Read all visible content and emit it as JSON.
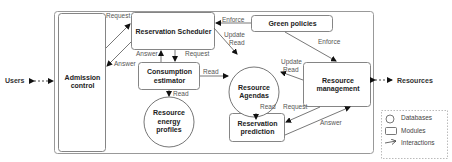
{
  "external": {
    "users": "Users",
    "resources": "Resources"
  },
  "modules": {
    "admission_control": "Admission control",
    "reservation_scheduler": "Reservation Scheduler",
    "consumption_estimator": "Consumption estimator",
    "green_policies": "Green policies",
    "resource_management": "Resource management",
    "reservation_prediction": "Reservation prediction"
  },
  "databases": {
    "resource_agendas": "Resource Agendas",
    "resource_energy_profiles": "Resource energy profiles"
  },
  "interactions": {
    "admission_to_scheduler": "Request",
    "scheduler_to_admission": "Answer",
    "estimator_to_scheduler": "Answer",
    "scheduler_to_estimator": "Request",
    "estimator_to_agendas": "Read",
    "estimator_to_profiles": "Read",
    "green_to_scheduler": "Enforce",
    "green_to_management": "Enforce",
    "scheduler_to_agendas_update": "Update",
    "scheduler_to_agendas_read": "Read",
    "management_to_agendas_update": "Update",
    "management_to_agendas_read": "Read",
    "prediction_to_agendas": "Read",
    "management_to_prediction": "Request",
    "prediction_to_management": "Answer"
  },
  "legend": {
    "databases": "Databases",
    "modules": "Modules",
    "interactions": "Interactions"
  },
  "colors": {
    "line": "#555555",
    "box_border": "#777777",
    "outer_border": "#999999",
    "legend_border": "#aaaaaa"
  }
}
